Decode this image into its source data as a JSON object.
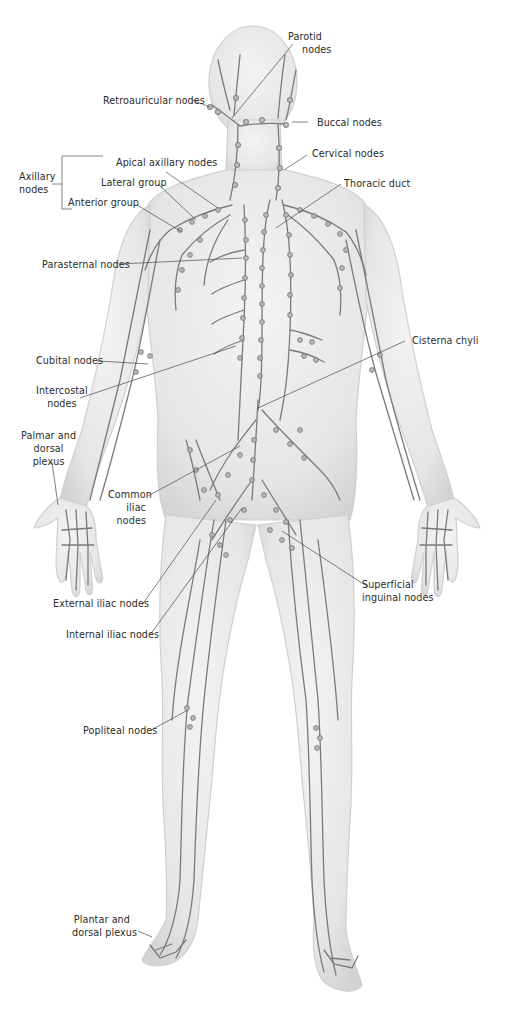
{
  "figure": {
    "colors": {
      "skin": "#ececec",
      "skin_shadow": "#d6d6d6",
      "vessel": "#7a7a7a",
      "node": "#b9b9b9",
      "leader": "#4a4a4a",
      "text": "#2b2b2b"
    }
  },
  "labels": {
    "parotid": {
      "line1": "Parotid",
      "line2": "nodes"
    },
    "retroauricular": {
      "text": "Retroauricular nodes"
    },
    "buccal": {
      "text": "Buccal nodes"
    },
    "cervical": {
      "text": "Cervical nodes"
    },
    "axillary_group": {
      "line1": "Axillary",
      "line2": "nodes"
    },
    "apical_axillary": {
      "text": "Apical axillary nodes"
    },
    "lateral_group": {
      "text": "Lateral group"
    },
    "anterior_group": {
      "text": "Anterior group"
    },
    "thoracic_duct": {
      "text": "Thoracic duct"
    },
    "parasternal": {
      "text": "Parasternal nodes"
    },
    "cisterna_chyli": {
      "text": "Cisterna chyli"
    },
    "cubital": {
      "text": "Cubital nodes"
    },
    "intercostal": {
      "line1": "Intercostal",
      "line2": "nodes"
    },
    "palmar_dorsal": {
      "line1": "Palmar and",
      "line2": "dorsal",
      "line3": "plexus"
    },
    "common_iliac": {
      "line1": "Common",
      "line2": "iliac",
      "line3": "nodes"
    },
    "superficial_inguinal": {
      "line1": "Superficial",
      "line2": "inguinal nodes"
    },
    "external_iliac": {
      "text": "External iliac nodes"
    },
    "internal_iliac": {
      "text": "Internal iliac nodes"
    },
    "popliteal": {
      "text": "Popliteal nodes"
    },
    "plantar_dorsal": {
      "line1": "Plantar and",
      "line2": "dorsal plexus"
    }
  }
}
